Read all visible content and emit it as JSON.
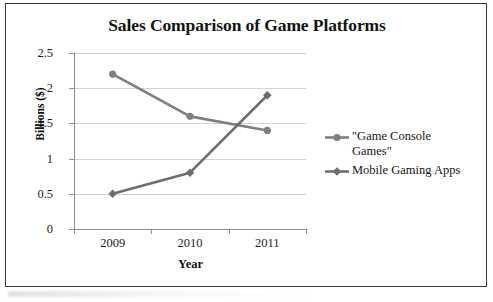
{
  "chart_data": {
    "type": "line",
    "title": "Sales Comparison of Game Platforms",
    "xlabel": "Year",
    "ylabel": "Billions ($)",
    "categories": [
      "2009",
      "2010",
      "2011"
    ],
    "ylim": [
      0,
      2.5
    ],
    "yticks": [
      "0",
      "0.5",
      "1",
      "1.5",
      "2",
      "2.5"
    ],
    "ytick_values": [
      0,
      0.5,
      1,
      1.5,
      2,
      2.5
    ],
    "grid": true,
    "legend_position": "right",
    "series": [
      {
        "name": "\"Game Console Games\"",
        "values": [
          2.2,
          1.6,
          1.4
        ],
        "marker": "circle",
        "color": "#7f7f7f"
      },
      {
        "name": "Mobile Gaming Apps",
        "values": [
          0.5,
          0.8,
          1.9
        ],
        "marker": "diamond",
        "color": "#6e6e6e"
      }
    ],
    "colors": {
      "series1": "#7f7f7f",
      "series2": "#6e6e6e",
      "gridline": "#d2d2d2",
      "axis": "#8f8f8f",
      "border": "#3a3a3a",
      "text": "#151515",
      "background": "#ffffff"
    }
  },
  "legend": {
    "entries": [
      {
        "label": "\"Game Console\nGames\"",
        "marker": "circle-marker"
      },
      {
        "label": "Mobile Gaming Apps",
        "marker": "diamond-marker"
      }
    ]
  }
}
